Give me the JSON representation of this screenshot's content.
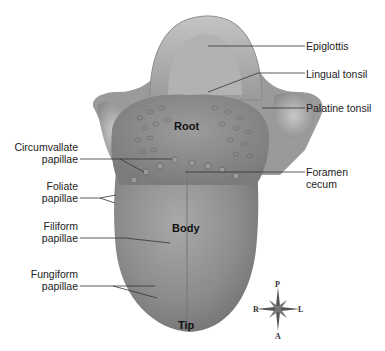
{
  "figure": {
    "regions": {
      "root": "Root",
      "body": "Body",
      "tip": "Tip"
    },
    "labels_right": {
      "epiglottis": "Epiglottis",
      "lingual_tonsil": "Lingual tonsil",
      "palatine_tonsil": "Palatine tonsil",
      "foramen_cecum_line1": "Foramen",
      "foramen_cecum_line2": "cecum"
    },
    "labels_left": {
      "circumvallate_line1": "Circumvallate",
      "circumvallate_line2": "papillae",
      "foliate_line1": "Foliate",
      "foliate_line2": "papillae",
      "filiform_line1": "Filiform",
      "filiform_line2": "papillae",
      "fungiform_line1": "Fungiform",
      "fungiform_line2": "papillae"
    },
    "compass": {
      "top": "P",
      "bottom": "A",
      "left": "R",
      "right": "L"
    },
    "colors": {
      "tissue": "#8a8a8a",
      "tissue_light": "#b5b5b5",
      "leader_line": "#333333",
      "text": "#222222"
    }
  }
}
